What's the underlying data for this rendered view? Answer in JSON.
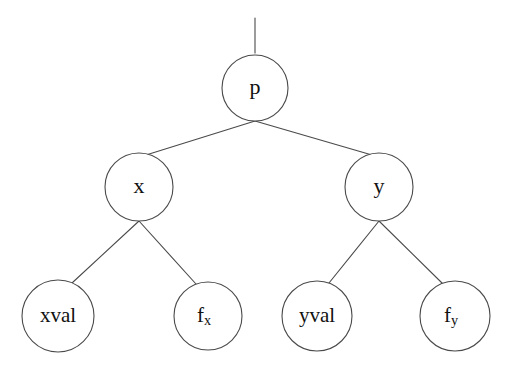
{
  "diagram": {
    "type": "tree",
    "background_color": "#ffffff",
    "stroke_color": "#4a4a4a",
    "text_color": "#111111",
    "root_stem": {
      "name": "root-stem",
      "x": 255,
      "y_top": 18,
      "y_bottom": 53
    },
    "nodes": [
      {
        "id": "p",
        "label": "p",
        "sub": "",
        "cx": 255,
        "cy": 88,
        "r": 33,
        "font_size": 22,
        "level": 0
      },
      {
        "id": "x",
        "label": "x",
        "sub": "",
        "cx": 139,
        "cy": 187,
        "r": 34,
        "font_size": 22,
        "level": 1
      },
      {
        "id": "y",
        "label": "y",
        "sub": "",
        "cx": 379,
        "cy": 187,
        "r": 34,
        "font_size": 22,
        "level": 1
      },
      {
        "id": "xval",
        "label": "xval",
        "sub": "",
        "cx": 58,
        "cy": 316,
        "r": 36,
        "font_size": 21,
        "level": 2
      },
      {
        "id": "fx",
        "label": "f",
        "sub": "x",
        "cx": 208,
        "cy": 316,
        "r": 34,
        "font_size": 21,
        "level": 2
      },
      {
        "id": "yval",
        "label": "yval",
        "sub": "",
        "cx": 317,
        "cy": 316,
        "r": 35,
        "font_size": 21,
        "level": 2
      },
      {
        "id": "fy",
        "label": "f",
        "sub": "y",
        "cx": 455,
        "cy": 316,
        "r": 35,
        "font_size": 21,
        "level": 2
      }
    ],
    "edges": [
      {
        "id": "p-x",
        "from": "p",
        "to": "x",
        "x1": 255,
        "y1": 121,
        "x2": 146,
        "y2": 155
      },
      {
        "id": "p-y",
        "from": "p",
        "to": "y",
        "x1": 255,
        "y1": 121,
        "x2": 372,
        "y2": 155
      },
      {
        "id": "x-xval",
        "from": "x",
        "to": "xval",
        "x1": 139,
        "y1": 221,
        "x2": 72,
        "y2": 283
      },
      {
        "id": "x-fx",
        "from": "x",
        "to": "fx",
        "x1": 139,
        "y1": 221,
        "x2": 196,
        "y2": 284
      },
      {
        "id": "y-yval",
        "from": "y",
        "to": "yval",
        "x1": 379,
        "y1": 221,
        "x2": 329,
        "y2": 283
      },
      {
        "id": "y-fy",
        "from": "y",
        "to": "fy",
        "x1": 379,
        "y1": 221,
        "x2": 442,
        "y2": 283
      }
    ]
  }
}
